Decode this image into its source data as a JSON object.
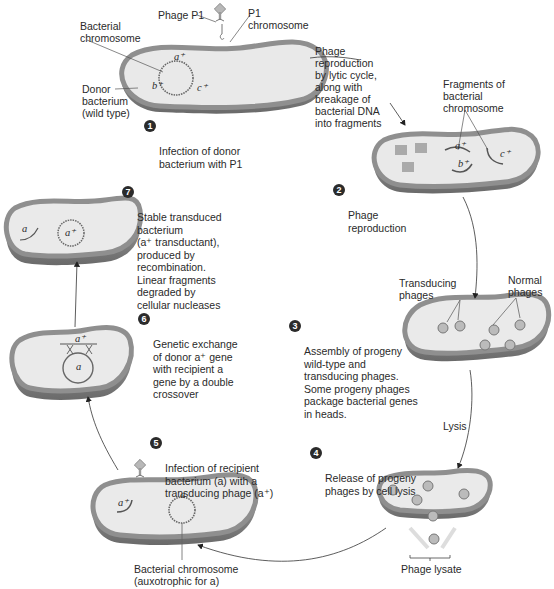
{
  "diagram": {
    "colors": {
      "cell_wall": "#8f8f8f",
      "cell_wall_dark": "#6e6e6e",
      "cytoplasm": "#e9e9e9",
      "text": "#2a2a2a",
      "badge": "#2b2b2b"
    },
    "stage1": {
      "labels": {
        "phage": "Phage P1",
        "p1_chromosome": "P1\nchromosome",
        "bacterial_chromosome": "Bacterial\nchromosome",
        "donor": "Donor\nbacterium\n(wild type)"
      },
      "genes": [
        "a⁺",
        "b⁺",
        "c⁺"
      ],
      "step_number": "1",
      "step_text": "Infection of donor\nbacterium with P1"
    },
    "transition_1_2": {
      "text": "Phage\nreproduction\nby lytic cycle,\nalong with\nbreakage of\nbacterial DNA\ninto fragments"
    },
    "stage2": {
      "labels": {
        "fragments": "Fragments of\nbacterial\nchromosome"
      },
      "genes": [
        "a⁺",
        "b⁺",
        "c⁺"
      ],
      "step_number": "2",
      "step_text": "Phage\nreproduction"
    },
    "stage3": {
      "labels": {
        "transducing": "Transducing\nphages",
        "normal": "Normal\nphages"
      },
      "step_number": "3",
      "step_text": "Assembly of progeny\nwild-type and\ntransducing phages.\nSome progeny phages\npackage bacterial genes\nin heads."
    },
    "transition_3_4": {
      "text": "Lysis"
    },
    "stage4": {
      "labels": {
        "lysate": "Phage lysate"
      },
      "step_number": "4",
      "step_text": "Release of progeny\nphages by cell lysis"
    },
    "stage5": {
      "labels": {
        "recipient_chromosome": "Bacterial chromosome\n(auxotrophic for a)"
      },
      "genes": [
        "a⁺",
        "a"
      ],
      "step_number": "5",
      "step_text": "Infection of recipient\nbacterium (a) with a\ntransducing phage (a⁺)"
    },
    "stage6": {
      "genes": [
        "a⁺",
        "a"
      ],
      "step_number": "6",
      "step_text": "Genetic exchange\nof donor a⁺ gene\nwith recipient a\ngene by a double\ncrossover"
    },
    "stage7": {
      "genes": [
        "a",
        "a⁺"
      ],
      "step_number": "7",
      "step_text": "Stable transduced\nbacterium\n(a⁺ transductant),\nproduced by\nrecombination.\nLinear fragments\ndegraded by\ncellular nucleases"
    }
  }
}
